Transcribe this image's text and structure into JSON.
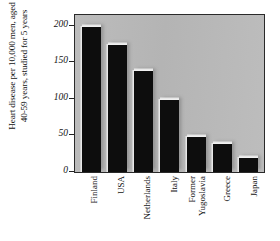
{
  "chart_data": {
    "type": "bar",
    "title": "",
    "xlabel": "",
    "ylabel_lines": [
      "Heart disease per 10,000 men, aged",
      "40-59 years, studied for 5 years"
    ],
    "ylabel": "Heart disease per 10,000 men, aged 40-59 years, studied for 5 years",
    "categories": [
      "Finland",
      "USA",
      "Netherlands",
      "Italy",
      "Former Yugoslavia",
      "Greece",
      "Japan"
    ],
    "category_lines": [
      [
        "Finland"
      ],
      [
        "USA"
      ],
      [
        "Netherlands"
      ],
      [
        "Italy"
      ],
      [
        "Former",
        "Yugoslavia"
      ],
      [
        "Greece"
      ],
      [
        "Japan"
      ]
    ],
    "values": [
      200,
      175,
      140,
      100,
      50,
      40,
      20
    ],
    "ylim": [
      0,
      215
    ],
    "yticks": [
      0,
      50,
      100,
      150,
      200
    ],
    "ytick_labels": [
      "0",
      "50",
      "100",
      "150",
      "200"
    ],
    "grid": false,
    "legend": null,
    "colors": {
      "bar": "#0d0d0d",
      "plot_background": "#b8b8b8",
      "frame": "#2a2a2a",
      "page_background": "#ffffff",
      "text": "#111111",
      "bar_highlight": "#e8e8e8"
    }
  }
}
